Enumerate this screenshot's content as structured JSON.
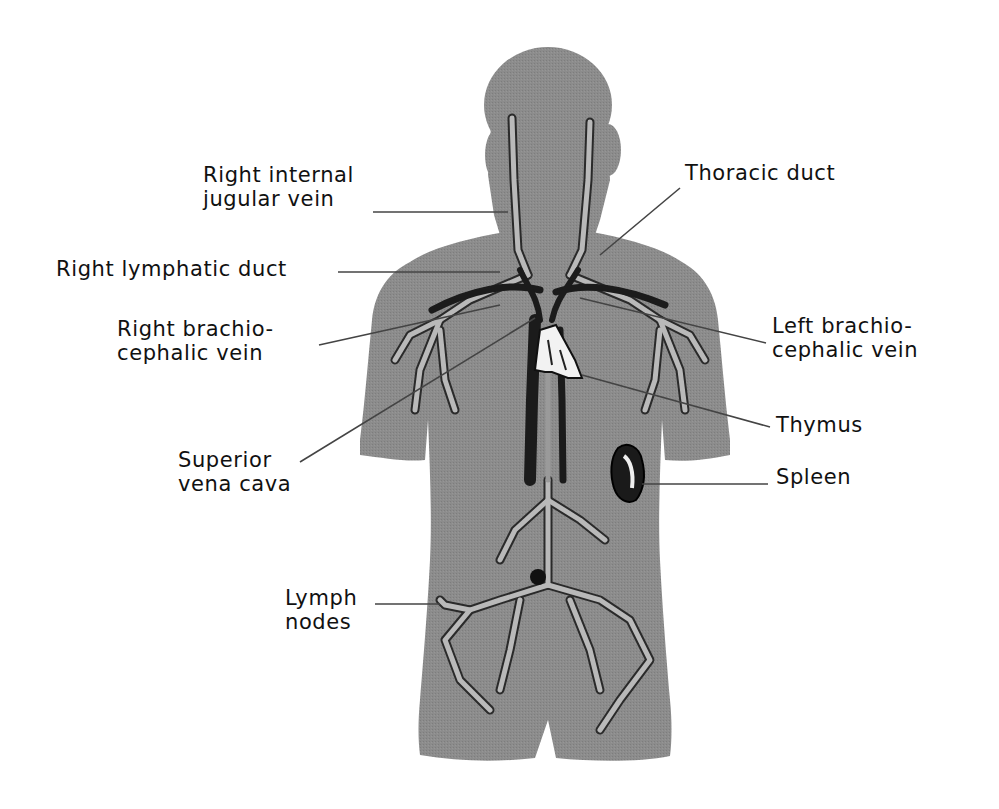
{
  "diagram": {
    "colors": {
      "background": "#ffffff",
      "body": "#8a8a8a",
      "lymph_vessel": "#b8b8b8",
      "dark_vessel": "#1e1e1e",
      "leader_line": "#444444",
      "text": "#111111"
    },
    "labels": [
      {
        "id": "right-internal-jugular-vein",
        "lines": [
          "Right internal",
          "jugular vein"
        ],
        "side": "left"
      },
      {
        "id": "right-lymphatic-duct",
        "lines": [
          "Right lymphatic duct"
        ],
        "side": "left"
      },
      {
        "id": "right-brachiocephalic-vein",
        "lines": [
          "Right brachio-",
          "cephalic vein"
        ],
        "side": "left"
      },
      {
        "id": "superior-vena-cava",
        "lines": [
          "Superior",
          "vena cava"
        ],
        "side": "left"
      },
      {
        "id": "lymph-nodes",
        "lines": [
          "Lymph",
          "nodes"
        ],
        "side": "left"
      },
      {
        "id": "thoracic-duct",
        "lines": [
          "Thoracic duct"
        ],
        "side": "right"
      },
      {
        "id": "left-brachiocephalic-vein",
        "lines": [
          "Left brachio-",
          "cephalic vein"
        ],
        "side": "right"
      },
      {
        "id": "thymus",
        "lines": [
          "Thymus"
        ],
        "side": "right"
      },
      {
        "id": "spleen",
        "lines": [
          "Spleen"
        ],
        "side": "right"
      }
    ]
  }
}
